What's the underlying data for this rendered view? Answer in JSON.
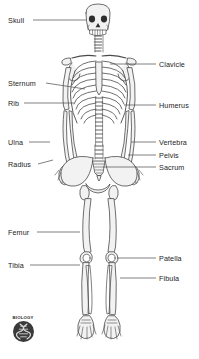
{
  "diagram": {
    "background_color": "#ffffff",
    "bone_line_color": "#4a4a4a",
    "bone_fill_color": "#f2f2f2",
    "label_color": "#1c1c1c",
    "leader_color": "#555555"
  },
  "labels": {
    "left": [
      {
        "text": "Skull",
        "text_x": 8,
        "text_y": 17,
        "line_x1": 33,
        "line_y1": 20,
        "line_x2": 86,
        "line_y2": 20
      },
      {
        "text": "Sternum",
        "text_x": 8,
        "text_y": 80,
        "line_x1": 46,
        "line_y1": 83,
        "line_x2": 85,
        "line_y2": 89
      },
      {
        "text": "Rib",
        "text_x": 8,
        "text_y": 100,
        "line_x1": 24,
        "line_y1": 103,
        "line_x2": 74,
        "line_y2": 103
      },
      {
        "text": "Ulna",
        "text_x": 8,
        "text_y": 139,
        "line_x1": 29,
        "line_y1": 142,
        "line_x2": 50,
        "line_y2": 142
      },
      {
        "text": "Radius",
        "text_x": 8,
        "text_y": 161,
        "line_x1": 38,
        "line_y1": 164,
        "line_x2": 53,
        "line_y2": 160
      },
      {
        "text": "Femur",
        "text_x": 8,
        "text_y": 229,
        "line_x1": 37,
        "line_y1": 232,
        "line_x2": 80,
        "line_y2": 232
      },
      {
        "text": "Tibia",
        "text_x": 8,
        "text_y": 262,
        "line_x1": 30,
        "line_y1": 265,
        "line_x2": 80,
        "line_y2": 265
      }
    ],
    "right": [
      {
        "text": "Clavicle",
        "text_x": 159,
        "text_y": 61,
        "line_x1": 110,
        "line_y1": 64,
        "line_x2": 156,
        "line_y2": 64
      },
      {
        "text": "Humerus",
        "text_x": 159,
        "text_y": 102,
        "line_x1": 124,
        "line_y1": 105,
        "line_x2": 156,
        "line_y2": 105
      },
      {
        "text": "Vertebra",
        "text_x": 159,
        "text_y": 139,
        "line_x1": 131,
        "line_y1": 142,
        "line_x2": 156,
        "line_y2": 142
      },
      {
        "text": "Pelvis",
        "text_x": 159,
        "text_y": 152,
        "line_x1": 128,
        "line_y1": 155,
        "line_x2": 156,
        "line_y2": 155
      },
      {
        "text": "Sacrum",
        "text_x": 159,
        "text_y": 164,
        "line_x1": 103,
        "line_y1": 167,
        "line_x2": 156,
        "line_y2": 167
      },
      {
        "text": "Patella",
        "text_x": 159,
        "text_y": 255,
        "line_x1": 117,
        "line_y1": 258,
        "line_x2": 156,
        "line_y2": 258
      },
      {
        "text": "Fibula",
        "text_x": 159,
        "text_y": 275,
        "line_x1": 120,
        "line_y1": 278,
        "line_x2": 156,
        "line_y2": 278
      }
    ]
  },
  "logo": {
    "caption": "BIOLOGY",
    "icon": "dna-helix-icon",
    "badge_color": "#3a3a3a"
  }
}
